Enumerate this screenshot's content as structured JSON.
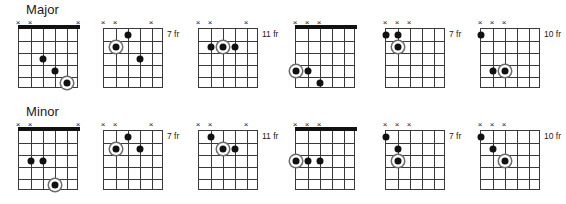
{
  "page": {
    "x_mark_glyph": "×",
    "strings": 6,
    "frets": 5,
    "ink_color": "#111111",
    "grid_color": "#3a3a3a",
    "root_ring_color": "#6b6b6b"
  },
  "rows": [
    {
      "name": "major-row",
      "label": "Major",
      "diagrams": [
        {
          "name": "major-voicing-1",
          "left": 18,
          "open_position": true,
          "nut": true,
          "fret_label": "",
          "muted_strings": [
            1,
            2,
            6
          ],
          "x_marks": [
            1,
            2,
            6
          ],
          "dots": [
            {
              "string": 3,
              "fret": 3,
              "root": false
            },
            {
              "string": 4,
              "fret": 4,
              "root": false
            },
            {
              "string": 5,
              "fret": 5,
              "root": true
            }
          ]
        },
        {
          "name": "major-voicing-2",
          "left": 103,
          "open_position": false,
          "nut": false,
          "fret_label": "7 fr",
          "muted_strings": [
            1,
            2,
            5
          ],
          "x_marks": [
            1,
            2,
            5
          ],
          "dots": [
            {
              "string": 3,
              "fret": 1,
              "root": false
            },
            {
              "string": 2,
              "fret": 2,
              "root": true
            },
            {
              "string": 4,
              "fret": 3,
              "root": false
            }
          ]
        },
        {
          "name": "major-voicing-3",
          "left": 198,
          "open_position": false,
          "nut": false,
          "fret_label": "11 fr",
          "muted_strings": [
            1,
            2,
            5
          ],
          "x_marks": [
            1,
            2,
            5
          ],
          "dots": [
            {
              "string": 4,
              "fret": 2,
              "root": false
            },
            {
              "string": 3,
              "fret": 2,
              "root": true
            },
            {
              "string": 2,
              "fret": 2,
              "root": false
            }
          ]
        },
        {
          "name": "major-voicing-4",
          "left": 295,
          "open_position": true,
          "nut": true,
          "fret_label": "",
          "muted_strings": [
            1,
            2,
            3
          ],
          "x_marks": [
            1,
            2,
            3
          ],
          "dots": [
            {
              "string": 2,
              "fret": 4,
              "root": false
            },
            {
              "string": 1,
              "fret": 4,
              "root": true
            },
            {
              "string": 3,
              "fret": 5,
              "root": false
            }
          ]
        },
        {
          "name": "major-voicing-5",
          "left": 385,
          "open_position": false,
          "nut": false,
          "fret_label": "7 fr",
          "muted_strings": [
            1,
            2,
            3
          ],
          "x_marks": [
            1,
            2,
            3
          ],
          "dots": [
            {
              "string": 2,
              "fret": 1,
              "root": false
            },
            {
              "string": 1,
              "fret": 1,
              "root": false
            },
            {
              "string": 2,
              "fret": 2,
              "root": true
            }
          ]
        },
        {
          "name": "major-voicing-6",
          "left": 480,
          "open_position": false,
          "nut": false,
          "fret_label": "10 fr",
          "muted_strings": [
            1,
            2,
            3
          ],
          "x_marks": [
            1,
            2,
            3
          ],
          "dots": [
            {
              "string": 1,
              "fret": 1,
              "root": false
            },
            {
              "string": 3,
              "fret": 4,
              "root": true
            },
            {
              "string": 2,
              "fret": 4,
              "root": false
            }
          ]
        }
      ]
    },
    {
      "name": "minor-row",
      "label": "Minor",
      "diagrams": [
        {
          "name": "minor-voicing-1",
          "left": 18,
          "open_position": true,
          "nut": true,
          "fret_label": "",
          "muted_strings": [
            1,
            2,
            6
          ],
          "x_marks": [
            1,
            2,
            6
          ],
          "dots": [
            {
              "string": 3,
              "fret": 3,
              "root": false
            },
            {
              "string": 2,
              "fret": 3,
              "root": false
            },
            {
              "string": 4,
              "fret": 5,
              "root": true
            }
          ]
        },
        {
          "name": "minor-voicing-2",
          "left": 103,
          "open_position": false,
          "nut": false,
          "fret_label": "7 fr",
          "muted_strings": [
            1,
            2,
            5
          ],
          "x_marks": [
            1,
            2,
            5
          ],
          "dots": [
            {
              "string": 3,
              "fret": 1,
              "root": false
            },
            {
              "string": 4,
              "fret": 2,
              "root": false
            },
            {
              "string": 2,
              "fret": 2,
              "root": true
            }
          ]
        },
        {
          "name": "minor-voicing-3",
          "left": 198,
          "open_position": false,
          "nut": false,
          "fret_label": "11 fr",
          "muted_strings": [
            1,
            2,
            5
          ],
          "x_marks": [
            1,
            2,
            5
          ],
          "dots": [
            {
              "string": 2,
              "fret": 1,
              "root": false
            },
            {
              "string": 4,
              "fret": 2,
              "root": false
            },
            {
              "string": 3,
              "fret": 2,
              "root": true
            }
          ]
        },
        {
          "name": "minor-voicing-4",
          "left": 295,
          "open_position": true,
          "nut": true,
          "fret_label": "",
          "muted_strings": [
            1,
            2,
            3
          ],
          "x_marks": [
            1,
            2,
            3
          ],
          "dots": [
            {
              "string": 3,
              "fret": 3,
              "root": false
            },
            {
              "string": 2,
              "fret": 3,
              "root": false
            },
            {
              "string": 1,
              "fret": 3,
              "root": true
            }
          ]
        },
        {
          "name": "minor-voicing-5",
          "left": 385,
          "open_position": false,
          "nut": false,
          "fret_label": "7 fr",
          "muted_strings": [
            1,
            2,
            3
          ],
          "x_marks": [
            1,
            2,
            3
          ],
          "dots": [
            {
              "string": 1,
              "fret": 1,
              "root": false
            },
            {
              "string": 2,
              "fret": 2,
              "root": false
            },
            {
              "string": 2,
              "fret": 3,
              "root": true
            }
          ]
        },
        {
          "name": "minor-voicing-6",
          "left": 480,
          "open_position": false,
          "nut": false,
          "fret_label": "10 fr",
          "muted_strings": [
            1,
            2,
            3
          ],
          "x_marks": [
            1,
            2,
            3
          ],
          "dots": [
            {
              "string": 1,
              "fret": 1,
              "root": false
            },
            {
              "string": 2,
              "fret": 2,
              "root": false
            },
            {
              "string": 3,
              "fret": 3,
              "root": true
            }
          ]
        }
      ]
    }
  ]
}
